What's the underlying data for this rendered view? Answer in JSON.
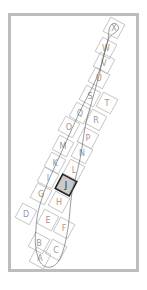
{
  "map": {
    "type": "grid-index-map",
    "selected_cell": "J",
    "colors": {
      "frame": "#bdbdbd",
      "grid": "#b5b5b5",
      "selected_fill": "#c9c9c9",
      "selected_stroke": "#222222",
      "coast": "#555555"
    },
    "cells": [
      {
        "id": "A",
        "x": 40,
        "y": 258
      },
      {
        "id": "B",
        "x": 39,
        "y": 243
      },
      {
        "id": "C",
        "x": 56,
        "y": 250
      },
      {
        "id": "D",
        "x": 26,
        "y": 214
      },
      {
        "id": "E",
        "x": 48,
        "y": 220
      },
      {
        "id": "F",
        "x": 64,
        "y": 228
      },
      {
        "id": "G",
        "x": 41,
        "y": 194
      },
      {
        "id": "H",
        "x": 59,
        "y": 202
      },
      {
        "id": "I",
        "x": 48,
        "y": 178
      },
      {
        "id": "J",
        "x": 66,
        "y": 185
      },
      {
        "id": "K",
        "x": 55,
        "y": 163
      },
      {
        "id": "L",
        "x": 74,
        "y": 170
      },
      {
        "id": "M",
        "x": 63,
        "y": 146
      },
      {
        "id": "N",
        "x": 82,
        "y": 153
      },
      {
        "id": "O",
        "x": 69,
        "y": 127
      },
      {
        "id": "P",
        "x": 88,
        "y": 138
      },
      {
        "id": "Q",
        "x": 80,
        "y": 113
      },
      {
        "id": "R",
        "x": 96,
        "y": 120
      },
      {
        "id": "S",
        "x": 90,
        "y": 96
      },
      {
        "id": "T",
        "x": 107,
        "y": 103
      },
      {
        "id": "U",
        "x": 99,
        "y": 78
      },
      {
        "id": "V",
        "x": 104,
        "y": 63
      },
      {
        "id": "W",
        "x": 106,
        "y": 48
      },
      {
        "id": "X",
        "x": 114,
        "y": 28
      }
    ]
  }
}
